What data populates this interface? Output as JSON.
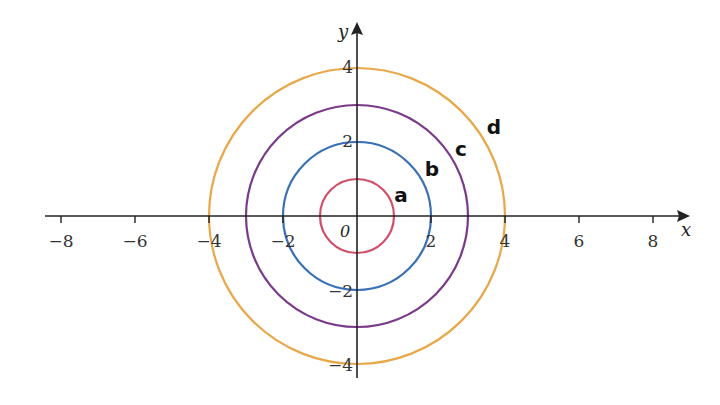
{
  "chart_data": {
    "type": "line",
    "title": "",
    "xlabel": "x",
    "ylabel": "y",
    "xlim": [
      -8.5,
      8.8
    ],
    "ylim": [
      -4.3,
      5
    ],
    "grid": false,
    "x_ticks": [
      -8,
      -6,
      -4,
      -2,
      2,
      4,
      6,
      8
    ],
    "x_tick_labels": [
      "−8",
      "−6",
      "−4",
      "−2",
      "2",
      "4",
      "6",
      "8"
    ],
    "y_ticks": [
      4,
      2,
      -2,
      -4
    ],
    "y_tick_labels": [
      "4",
      "2",
      "−2",
      "−4"
    ],
    "origin_label": "0",
    "series": [
      {
        "name": "a",
        "shape": "circle",
        "center": [
          0,
          0
        ],
        "radius": 1,
        "color": "#d0506a"
      },
      {
        "name": "b",
        "shape": "circle",
        "center": [
          0,
          0
        ],
        "radius": 2,
        "color": "#3a6fb5"
      },
      {
        "name": "c",
        "shape": "circle",
        "center": [
          0,
          0
        ],
        "radius": 3,
        "color": "#7a3a8a"
      },
      {
        "name": "d",
        "shape": "circle",
        "center": [
          0,
          0
        ],
        "radius": 4,
        "color": "#e8a84a"
      }
    ]
  }
}
